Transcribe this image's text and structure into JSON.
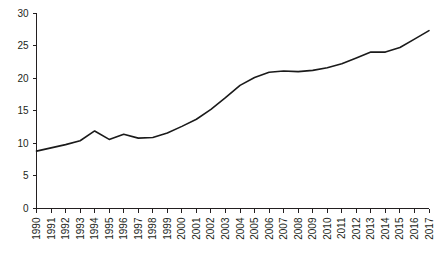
{
  "chart_data": {
    "type": "line",
    "title": "",
    "subtitle": "",
    "xlabel": "",
    "ylabel": "",
    "grid": false,
    "legend": "none",
    "xlim": [
      1990,
      2017
    ],
    "ylim": [
      0,
      30
    ],
    "y_ticks": [
      0,
      5,
      10,
      15,
      20,
      25,
      30
    ],
    "x": [
      1990,
      1991,
      1992,
      1993,
      1994,
      1995,
      1996,
      1997,
      1998,
      1999,
      2000,
      2001,
      2002,
      2003,
      2004,
      2005,
      2006,
      2007,
      2008,
      2009,
      2010,
      2011,
      2012,
      2013,
      2014,
      2015,
      2016,
      2017
    ],
    "categories": [
      "1990",
      "1991",
      "1992",
      "1993",
      "1994",
      "1995",
      "1996",
      "1997",
      "1998",
      "1999",
      "2000",
      "2001",
      "2002",
      "2003",
      "2004",
      "2005",
      "2006",
      "2007",
      "2008",
      "2009",
      "2010",
      "2011",
      "2012",
      "2013",
      "2014",
      "2015",
      "2016",
      "2017"
    ],
    "series": [
      {
        "name": "value",
        "color": "#1a1a1a",
        "values": [
          8.8,
          9.3,
          9.8,
          10.4,
          11.9,
          10.6,
          11.4,
          10.8,
          10.9,
          11.6,
          12.6,
          13.7,
          15.2,
          17.0,
          18.9,
          20.1,
          20.9,
          21.1,
          21.0,
          21.2,
          21.6,
          22.2,
          23.1,
          24.0,
          24.0,
          24.7,
          26.0,
          27.3
        ]
      }
    ]
  },
  "axes": {
    "y_tick_labels": [
      "0",
      "5",
      "10",
      "15",
      "20",
      "25",
      "30"
    ],
    "x_tick_labels": [
      "1990",
      "1991",
      "1992",
      "1993",
      "1994",
      "1995",
      "1996",
      "1997",
      "1998",
      "1999",
      "2000",
      "2001",
      "2002",
      "2003",
      "2004",
      "2005",
      "2006",
      "2007",
      "2008",
      "2009",
      "2010",
      "2011",
      "2012",
      "2013",
      "2014",
      "2015",
      "2016",
      "2017"
    ]
  },
  "colors": {
    "line": "#1a1a1a",
    "axis": "#231f20",
    "background": "#ffffff"
  }
}
